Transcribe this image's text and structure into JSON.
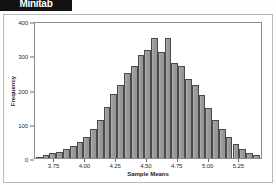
{
  "app": {
    "logo_label": "Minitab"
  },
  "chart_data": {
    "type": "bar",
    "title": "",
    "xlabel": "Sample Means",
    "ylabel": "Frequency",
    "xlim": [
      3.6,
      5.45
    ],
    "ylim": [
      0,
      400
    ],
    "grid": false,
    "legend": null,
    "bar_color": "#9d9d9d",
    "bar_edge_color": "#4a4a4a",
    "xticks": [
      3.75,
      4.0,
      4.25,
      4.5,
      4.75,
      5.0,
      5.25
    ],
    "xtick_labels": [
      "3.75",
      "4.00",
      "4.25",
      "4.50",
      "4.75",
      "5.00",
      "5.25"
    ],
    "yticks": [
      0,
      100,
      200,
      300,
      400
    ],
    "ytick_labels": [
      "0",
      "100",
      "200",
      "300",
      "400"
    ],
    "bin_width": 0.055,
    "bin_centers": [
      3.635,
      3.69,
      3.745,
      3.8,
      3.855,
      3.91,
      3.965,
      4.02,
      4.075,
      4.13,
      4.185,
      4.24,
      4.295,
      4.35,
      4.405,
      4.46,
      4.515,
      4.57,
      4.625,
      4.68,
      4.735,
      4.79,
      4.845,
      4.9,
      4.955,
      5.01,
      5.065,
      5.12,
      5.175,
      5.23,
      5.285,
      5.34,
      5.395
    ],
    "values": [
      4,
      8,
      14,
      18,
      26,
      34,
      46,
      62,
      86,
      112,
      148,
      186,
      214,
      248,
      268,
      300,
      316,
      350,
      310,
      350,
      278,
      268,
      230,
      212,
      184,
      146,
      112,
      84,
      62,
      40,
      26,
      16,
      10
    ]
  }
}
